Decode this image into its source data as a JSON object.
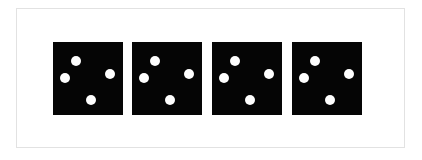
{
  "scene": {
    "title": "Four dice showing four pips each",
    "background_color": "#ffffff",
    "frame": {
      "border_color": "#e2e2e2",
      "fill_color": "#ffffff"
    },
    "die_face_color": "#050505",
    "pip_color": "#fefefe",
    "die_count": 4,
    "pips_per_die": 4,
    "dice": [
      {
        "name": "die-1",
        "value": "4",
        "pips": [
          {
            "name": "pip-upper-left",
            "label": "1"
          },
          {
            "name": "pip-mid-left",
            "label": "2"
          },
          {
            "name": "pip-mid-right",
            "label": "3"
          },
          {
            "name": "pip-lower-mid",
            "label": "4"
          }
        ]
      },
      {
        "name": "die-2",
        "value": "4",
        "pips": [
          {
            "name": "pip-upper-left",
            "label": "1"
          },
          {
            "name": "pip-mid-left",
            "label": "2"
          },
          {
            "name": "pip-mid-right",
            "label": "3"
          },
          {
            "name": "pip-lower-mid",
            "label": "4"
          }
        ]
      },
      {
        "name": "die-3",
        "value": "4",
        "pips": [
          {
            "name": "pip-upper-left",
            "label": "1"
          },
          {
            "name": "pip-mid-left",
            "label": "2"
          },
          {
            "name": "pip-mid-right",
            "label": "3"
          },
          {
            "name": "pip-lower-mid",
            "label": "4"
          }
        ]
      },
      {
        "name": "die-4",
        "value": "4",
        "pips": [
          {
            "name": "pip-upper-left",
            "label": "1"
          },
          {
            "name": "pip-mid-left",
            "label": "2"
          },
          {
            "name": "pip-mid-right",
            "label": "3"
          },
          {
            "name": "pip-lower-mid",
            "label": "4"
          }
        ]
      }
    ]
  }
}
